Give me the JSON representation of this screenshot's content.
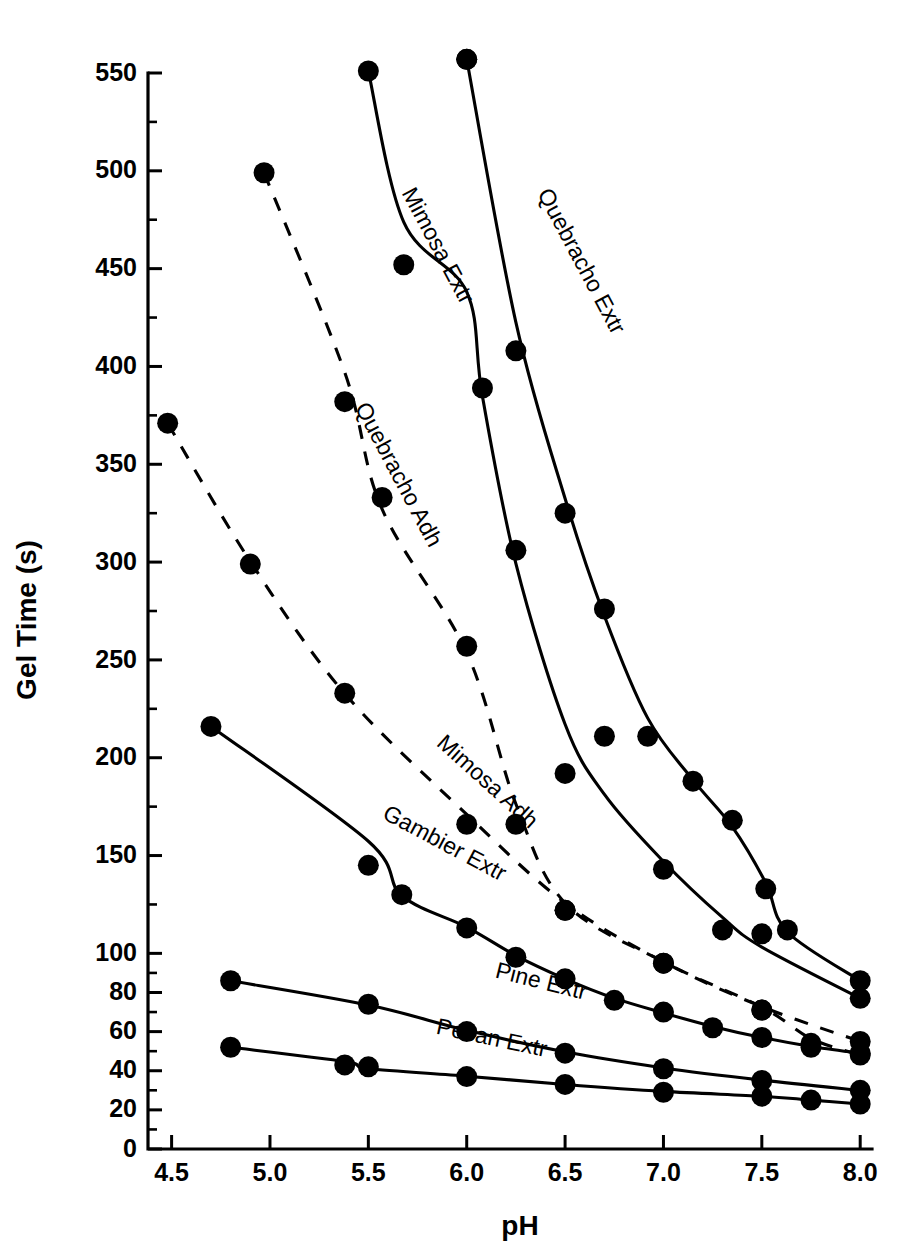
{
  "chart_data": {
    "type": "line",
    "title": "",
    "xlabel": "pH",
    "ylabel": "Gel Time (s)",
    "xlim": [
      4.38,
      8.06
    ],
    "ylim": [
      0,
      560
    ],
    "grid": false,
    "legend_position": "inline-curve-labels",
    "x_ticks": [
      4.5,
      5.0,
      5.5,
      6.0,
      6.5,
      7.0,
      7.5,
      8.0
    ],
    "x_tick_labels": [
      "4.5",
      "5.0",
      "5.5",
      "6.0",
      "6.5",
      "7.0",
      "7.5",
      "8.0"
    ],
    "y_ticks": [
      0,
      20,
      40,
      60,
      80,
      100,
      150,
      200,
      250,
      300,
      350,
      400,
      450,
      500,
      550
    ],
    "y_tick_labels": [
      "0",
      "20",
      "40",
      "60",
      "80",
      "100",
      "150",
      "200",
      "250",
      "300",
      "350",
      "400",
      "450",
      "500",
      "550"
    ],
    "y_minor_ticks": [
      10,
      30,
      50,
      70,
      90,
      125,
      175,
      225,
      275,
      325,
      375,
      425,
      475,
      525
    ],
    "series": [
      {
        "name": "Quebracho Extr",
        "style": "solid",
        "label_x": 6.55,
        "label_y": 452,
        "label_rotation": 62,
        "x": [
          6.0,
          6.25,
          6.5,
          6.7,
          6.92,
          7.15,
          7.35,
          7.52,
          7.63,
          8.0
        ],
        "y": [
          557,
          408,
          325,
          276,
          211,
          188,
          168,
          133,
          112,
          86
        ]
      },
      {
        "name": "Mimosa Extr",
        "style": "solid",
        "label_x": 5.82,
        "label_y": 460,
        "label_rotation": 62,
        "x": [
          5.5,
          5.68,
          6.0,
          6.08,
          6.25,
          6.5,
          6.7,
          7.0,
          7.3,
          7.5,
          8.0
        ],
        "y": [
          551,
          452,
          557,
          389,
          306,
          192,
          211,
          143,
          112,
          110,
          77
        ]
      },
      {
        "name": "Quebracho Adh",
        "style": "dashed",
        "label_x": 5.62,
        "label_y": 343,
        "label_rotation": 62,
        "x": [
          4.97,
          5.38,
          5.57,
          6.0,
          6.25,
          6.5,
          7.0,
          7.5,
          8.0
        ],
        "y": [
          499,
          382,
          333,
          257,
          166,
          122,
          95,
          71,
          55
        ]
      },
      {
        "name": "Mimosa Adh",
        "style": "dashed",
        "label_x": 6.08,
        "label_y": 185,
        "label_rotation": 42,
        "x": [
          4.48,
          4.9,
          5.38,
          6.0,
          6.5,
          7.0,
          7.5,
          7.75,
          8.0
        ],
        "y": [
          371,
          299,
          233,
          166,
          122,
          95,
          71,
          54,
          48
        ]
      },
      {
        "name": "Gambier Extr",
        "style": "solid",
        "label_x": 5.87,
        "label_y": 153,
        "label_rotation": 28,
        "x": [
          4.7,
          5.5,
          5.67,
          6.0,
          6.25,
          6.5,
          6.75,
          7.0,
          7.25,
          7.5,
          7.75,
          8.0
        ],
        "y": [
          216,
          145,
          130,
          113,
          98,
          87,
          76,
          70,
          62,
          57,
          52,
          49
        ]
      },
      {
        "name": "Pine Extr",
        "style": "solid",
        "label_x": 6.37,
        "label_y": 82,
        "label_rotation": 14,
        "x": [
          4.8,
          5.5,
          6.0,
          6.5,
          7.0,
          7.5,
          8.0
        ],
        "y": [
          86,
          74,
          60,
          49,
          41,
          35,
          30
        ]
      },
      {
        "name": "Pecan Extr",
        "style": "solid",
        "label_x": 6.12,
        "label_y": 53,
        "label_rotation": 12,
        "x": [
          4.8,
          5.38,
          5.5,
          6.0,
          6.5,
          7.0,
          7.5,
          7.75,
          8.0
        ],
        "y": [
          52,
          43,
          42,
          37,
          33,
          29,
          27,
          25,
          23
        ]
      }
    ]
  },
  "colors": {
    "ink": "#000000",
    "background": "#ffffff"
  }
}
